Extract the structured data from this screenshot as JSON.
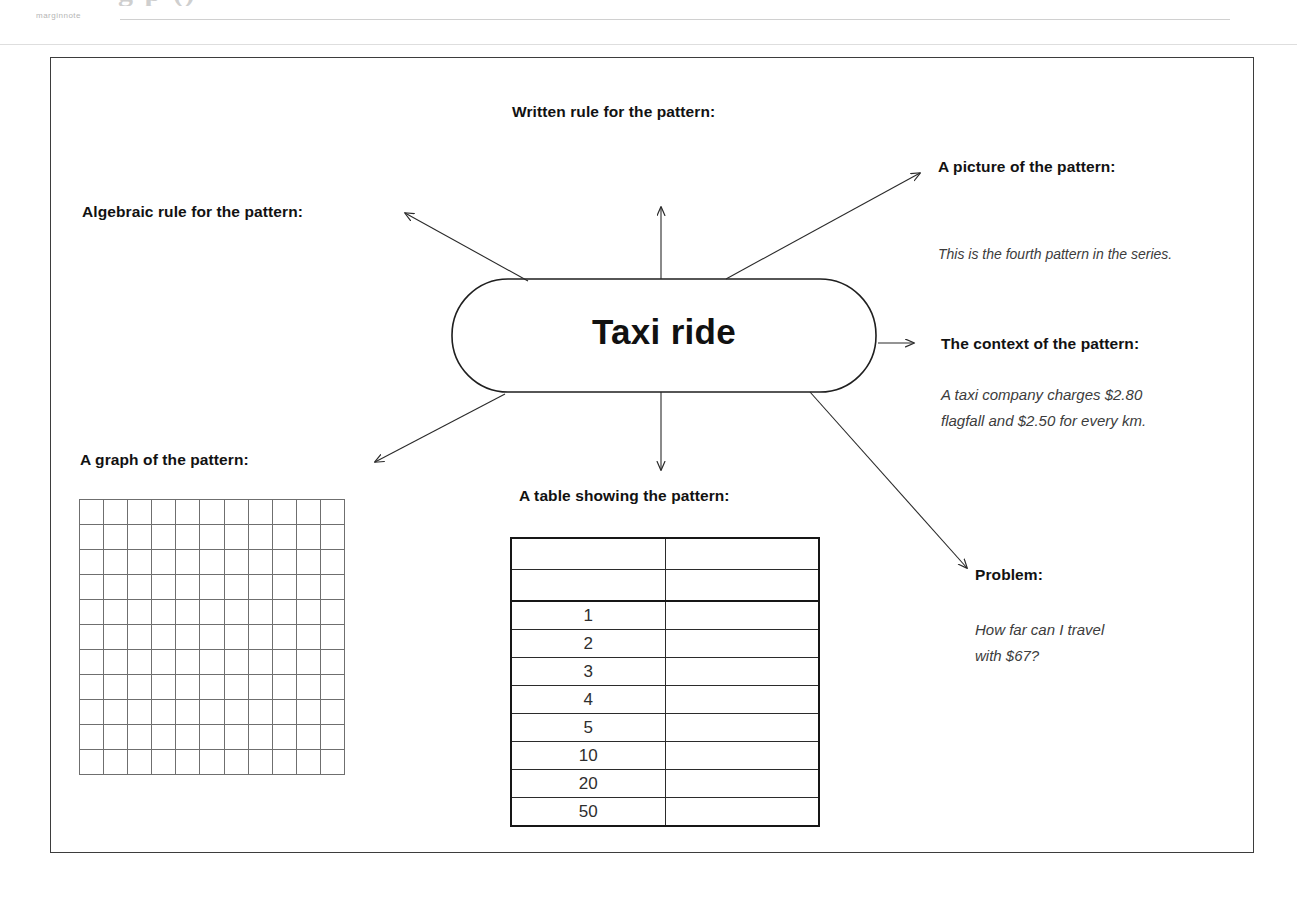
{
  "page": {
    "ghost_title": "g                    p              ()",
    "ghost_margin_note": "marginnote"
  },
  "diagram": {
    "central_node": "Taxi ride",
    "nodes": [
      {
        "id": "written-rule",
        "label": "Written rule for the pattern:",
        "body": ""
      },
      {
        "id": "algebraic-rule",
        "label": "Algebraic rule for the pattern:",
        "body": ""
      },
      {
        "id": "picture",
        "label": "A picture of the pattern:",
        "body": "This is the fourth pattern in the series."
      },
      {
        "id": "context",
        "label": "The context of the pattern:",
        "body": "A taxi company charges $2.80\nflagfall and $2.50 for every km."
      },
      {
        "id": "problem",
        "label": "Problem:",
        "body": "How far can I travel\nwith $67?"
      },
      {
        "id": "graph",
        "label": "A graph of the pattern:",
        "body": ""
      },
      {
        "id": "table",
        "label": "A table showing the pattern:",
        "body": ""
      }
    ]
  },
  "graph_grid": {
    "columns": 11,
    "rows": 11
  },
  "pattern_table": {
    "columns": 2,
    "rows": [
      {
        "cells": [
          "",
          ""
        ]
      },
      {
        "cells": [
          "",
          ""
        ]
      },
      {
        "cells": [
          "1",
          ""
        ]
      },
      {
        "cells": [
          "2",
          ""
        ]
      },
      {
        "cells": [
          "3",
          ""
        ]
      },
      {
        "cells": [
          "4",
          ""
        ]
      },
      {
        "cells": [
          "5",
          ""
        ]
      },
      {
        "cells": [
          "10",
          ""
        ]
      },
      {
        "cells": [
          "20",
          ""
        ]
      },
      {
        "cells": [
          "50",
          ""
        ]
      }
    ]
  },
  "colors": {
    "ink": "#111111",
    "rule": "#3d3d3d",
    "grid": "#6f6f6f",
    "italic_text": "#3c3c3c"
  }
}
